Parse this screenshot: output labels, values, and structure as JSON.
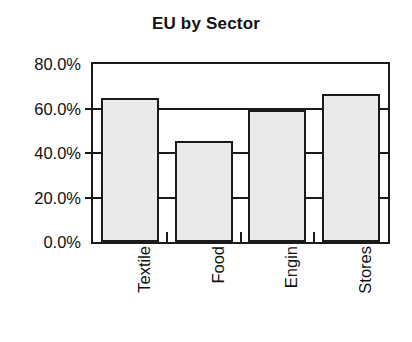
{
  "chart_data": {
    "type": "bar",
    "title": "EU by Sector",
    "xlabel": "",
    "ylabel": "",
    "categories": [
      "Textile",
      "Food",
      "Engin",
      "Stores"
    ],
    "values": [
      64.8,
      45.5,
      59.3,
      66.3
    ],
    "value_labels": [
      "64.8%",
      "45.5%",
      "59.3%",
      "66.3%"
    ],
    "ylim": [
      0,
      80
    ],
    "ytick_values": [
      0,
      20,
      40,
      60,
      80
    ],
    "ytick_labels": [
      "0.0%",
      "20.0%",
      "40.0%",
      "60.0%",
      "80.0%"
    ],
    "grid": true,
    "legend": "none",
    "legend_position": "none",
    "colors": {
      "bar_fill": "#e0e0e0",
      "bar_border": "#1a1a1a",
      "axis": "#1a1a1a",
      "grid": "#1a1a1a",
      "text": "#111111",
      "background": "#ffffff"
    }
  }
}
